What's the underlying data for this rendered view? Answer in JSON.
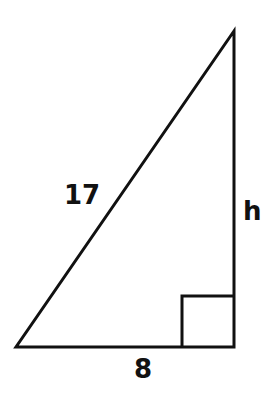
{
  "diagram": {
    "type": "right-triangle",
    "vertices": {
      "top": [
        234,
        31
      ],
      "bottom_left": [
        16,
        347
      ],
      "right_angle": [
        234,
        347
      ]
    },
    "right_angle_marker": {
      "x": 182,
      "y": 296,
      "size": 51
    },
    "stroke_color": "#111111",
    "background_color": "#ffffff",
    "labels": {
      "hypotenuse": "17",
      "height": "h",
      "base": "8"
    }
  }
}
